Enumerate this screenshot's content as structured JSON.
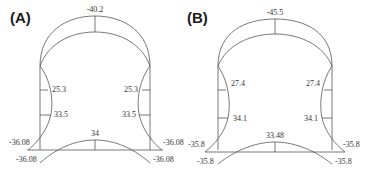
{
  "panels": [
    {
      "id": "A",
      "label": "(A)",
      "crown": "-40.2",
      "upper_left": "25.3",
      "upper_right": "25.3",
      "mid_left": "33.5",
      "mid_right": "33.5",
      "corner_left_upper": "-36.08",
      "corner_right_upper": "-36.08",
      "corner_left_lower": "-36.08",
      "corner_right_lower": "-36.08",
      "invert": "34"
    },
    {
      "id": "B",
      "label": "(B)",
      "crown": "-45.5",
      "upper_left": "27.4",
      "upper_right": "27.4",
      "mid_left": "34.1",
      "mid_right": "34.1",
      "corner_left_upper": "-35.8",
      "corner_right_upper": "-35.8",
      "corner_left_lower": "-35.8",
      "corner_right_lower": "-35.8",
      "invert": "33.48"
    }
  ],
  "colors": {
    "line": "#555555",
    "text": "#333333"
  }
}
